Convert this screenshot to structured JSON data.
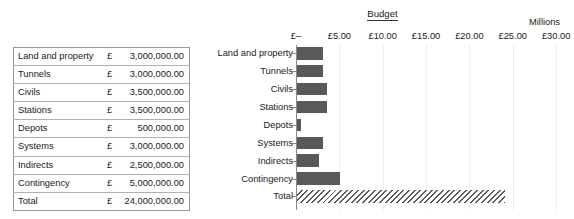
{
  "table": {
    "columns": [
      "Category",
      "Currency",
      "Amount"
    ],
    "rows": [
      {
        "category": "Land and property",
        "currency": "£",
        "amount": "3,000,000.00"
      },
      {
        "category": "Tunnels",
        "currency": "£",
        "amount": "3,000,000.00"
      },
      {
        "category": "Civils",
        "currency": "£",
        "amount": "3,500,000.00"
      },
      {
        "category": "Stations",
        "currency": "£",
        "amount": "3,500,000.00"
      },
      {
        "category": "Depots",
        "currency": "£",
        "amount": "500,000.00"
      },
      {
        "category": "Systems",
        "currency": "£",
        "amount": "3,000,000.00"
      },
      {
        "category": "Indirects",
        "currency": "£",
        "amount": "2,500,000.00"
      },
      {
        "category": "Contingency",
        "currency": "£",
        "amount": "5,000,000.00"
      },
      {
        "category": "Total",
        "currency": "£",
        "amount": "24,000,000.00"
      }
    ]
  },
  "chart_data": {
    "type": "bar",
    "orientation": "horizontal",
    "title": "Budget",
    "units_label": "Millions",
    "xlabel": "",
    "ylabel": "",
    "categories": [
      "Land and property",
      "Tunnels",
      "Civils",
      "Stations",
      "Depots",
      "Systems",
      "Indirects",
      "Contingency",
      "Total"
    ],
    "values": [
      3.0,
      3.0,
      3.5,
      3.5,
      0.5,
      3.0,
      2.5,
      5.0,
      24.0
    ],
    "value_unit": "millions GBP",
    "xlim": [
      0,
      30
    ],
    "xticks": [
      0,
      5,
      10,
      15,
      20,
      25,
      30
    ],
    "xtick_labels": [
      "£–",
      "£5.00",
      "£10.00",
      "£15.00",
      "£20.00",
      "£25.00",
      "£30.00"
    ],
    "grid": true,
    "legend": "none",
    "bar_color": "#595959",
    "total_bar_style": "hatched",
    "total_bar_hatch_color": "#5a5a5a"
  }
}
